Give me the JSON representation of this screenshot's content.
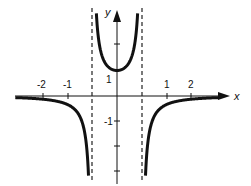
{
  "chart_data": {
    "type": "line",
    "title": "",
    "function": "y = 1/(1 - x^2)",
    "xlabel": "x",
    "ylabel": "y",
    "xlim": [
      -4.1,
      4.4
    ],
    "ylim": [
      -3.4,
      3.4
    ],
    "x_ticks": [
      -2,
      -1,
      1,
      2
    ],
    "x_tick_labels": [
      "-2",
      "-1",
      "1",
      "2"
    ],
    "y_ticks": [
      3,
      2,
      1,
      -1,
      -2,
      -3
    ],
    "y_tick_labels_shown": {
      "1": "1",
      "-1": "-1"
    },
    "asymptotes": {
      "vertical": [
        -1,
        1
      ],
      "horizontal": [
        0
      ]
    },
    "grid": false,
    "legend": null,
    "series": [
      {
        "name": "left branch",
        "x": [
          -4.1,
          -3,
          -2,
          -1.5,
          -1.25,
          -1.16
        ],
        "y": [
          -0.063,
          -0.125,
          -0.333,
          -0.8,
          -1.78,
          -2.9
        ]
      },
      {
        "name": "middle branch",
        "x": [
          -0.93,
          -0.8,
          -0.5,
          0,
          0.5,
          0.8,
          0.93
        ],
        "y": [
          7.4,
          2.78,
          1.333,
          1,
          1.333,
          2.78,
          7.4
        ]
      },
      {
        "name": "right branch",
        "x": [
          1.16,
          1.25,
          1.5,
          2,
          3,
          4.1
        ],
        "y": [
          -2.9,
          -1.78,
          -0.8,
          -0.333,
          -0.125,
          -0.063
        ]
      }
    ]
  },
  "labels": {
    "x_axis": "x",
    "y_axis": "y",
    "xt_m2": "-2",
    "xt_m1": "-1",
    "xt_1": "1",
    "xt_2": "2",
    "yt_1": "1",
    "yt_m1": "-1"
  }
}
